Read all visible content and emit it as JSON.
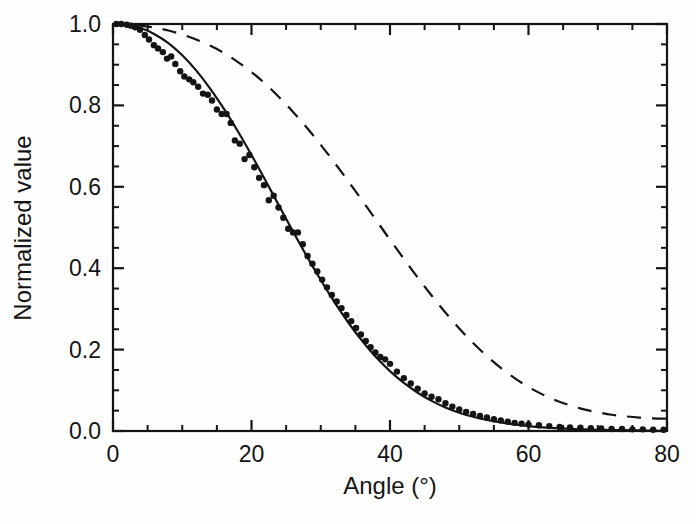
{
  "figure": {
    "background_color": "#fefefe",
    "ink_color": "#141414"
  },
  "chart_data": {
    "type": "line",
    "title": "",
    "subtitle": "",
    "xlabel": "Angle (°)",
    "ylabel": "Normalized value",
    "xlim": [
      0,
      80
    ],
    "ylim": [
      0.0,
      1.0
    ],
    "grid": false,
    "legend": null,
    "legend_position": "none",
    "frame": "box-all-sides",
    "tick_direction": "in",
    "xticks": [
      0,
      20,
      40,
      60,
      80
    ],
    "xtick_labels": [
      "0",
      "20",
      "40",
      "60",
      "80"
    ],
    "x_minor_tick_step": 5,
    "yticks": [
      0.0,
      0.2,
      0.4,
      0.6,
      0.8,
      1.0
    ],
    "ytick_labels": [
      "0.0",
      "0.2",
      "0.4",
      "0.6",
      "0.8",
      "1.0"
    ],
    "y_minor_tick_step": 0.05,
    "series": [
      {
        "name": "measured-fit",
        "style": "solid",
        "color": "#141414",
        "linewidth": 2.2,
        "has_markers": true,
        "marker": "filled-circle",
        "x": [
          0,
          2,
          4,
          6,
          8,
          10,
          12,
          14,
          16,
          18,
          20,
          22,
          24,
          26,
          28,
          30,
          32,
          34,
          36,
          38,
          40,
          42,
          44,
          46,
          48,
          50,
          52,
          54,
          56,
          58,
          60,
          62,
          64,
          66,
          68,
          70,
          72,
          74,
          76,
          78,
          80
        ],
        "values": [
          1.0,
          0.998,
          0.99,
          0.975,
          0.953,
          0.923,
          0.886,
          0.842,
          0.792,
          0.737,
          0.678,
          0.616,
          0.553,
          0.49,
          0.429,
          0.371,
          0.316,
          0.266,
          0.221,
          0.181,
          0.147,
          0.118,
          0.094,
          0.074,
          0.058,
          0.045,
          0.035,
          0.027,
          0.021,
          0.016,
          0.012,
          0.009,
          0.007,
          0.005,
          0.004,
          0.003,
          0.0025,
          0.002,
          0.0015,
          0.001,
          0.0
        ]
      },
      {
        "name": "model-prediction",
        "style": "dashed",
        "color": "#141414",
        "linewidth": 2.2,
        "has_markers": false,
        "marker": "none",
        "x": [
          0,
          2,
          4,
          6,
          8,
          10,
          12,
          14,
          16,
          18,
          20,
          22,
          24,
          26,
          28,
          30,
          32,
          34,
          36,
          38,
          40,
          42,
          44,
          46,
          48,
          50,
          52,
          54,
          56,
          58,
          60,
          62,
          64,
          66,
          68,
          70,
          72,
          74,
          76,
          78,
          80
        ],
        "values": [
          1.0,
          0.999,
          0.996,
          0.991,
          0.984,
          0.974,
          0.962,
          0.947,
          0.929,
          0.907,
          0.882,
          0.853,
          0.82,
          0.784,
          0.745,
          0.703,
          0.659,
          0.613,
          0.566,
          0.518,
          0.47,
          0.423,
          0.377,
          0.333,
          0.291,
          0.252,
          0.216,
          0.184,
          0.155,
          0.13,
          0.108,
          0.09,
          0.075,
          0.063,
          0.053,
          0.046,
          0.04,
          0.036,
          0.033,
          0.031,
          0.03
        ]
      }
    ],
    "scatter_points": {
      "name": "measured-data-points",
      "marker": "filled-circle",
      "color": "#141414",
      "size": 3.2,
      "x": [
        0.5,
        1.2,
        2.0,
        2.6,
        3.2,
        3.9,
        4.6,
        5.2,
        5.9,
        6.5,
        7.2,
        7.8,
        8.4,
        9.0,
        9.7,
        10.3,
        11.0,
        11.6,
        12.3,
        13.0,
        13.7,
        14.3,
        15.0,
        15.7,
        16.4,
        17.0,
        17.6,
        18.3,
        19.0,
        19.7,
        20.4,
        21.1,
        21.8,
        22.5,
        23.2,
        23.9,
        24.6,
        25.3,
        26.0,
        26.7,
        27.4,
        28.1,
        28.8,
        29.5,
        30.2,
        30.9,
        31.6,
        32.3,
        33.0,
        33.7,
        34.4,
        35.1,
        35.8,
        36.5,
        37.2,
        37.9,
        38.6,
        39.3,
        40.0,
        41.0,
        42.0,
        43.0,
        44.0,
        45.0,
        46.0,
        47.0,
        48.0,
        49.0,
        50.0,
        51.0,
        52.0,
        53.0,
        54.0,
        55.0,
        56.0,
        57.0,
        58.0,
        59.0,
        60.0,
        61.5,
        63.0,
        64.5,
        66.0,
        67.5,
        69.0,
        70.5,
        72.0,
        73.5,
        75.0,
        76.5,
        78.0,
        79.5
      ],
      "y": [
        1.0,
        1.0,
        0.998,
        0.996,
        0.992,
        0.986,
        0.973,
        0.962,
        0.948,
        0.94,
        0.931,
        0.915,
        0.92,
        0.902,
        0.884,
        0.871,
        0.864,
        0.857,
        0.846,
        0.829,
        0.826,
        0.812,
        0.79,
        0.779,
        0.779,
        0.757,
        0.714,
        0.706,
        0.668,
        0.678,
        0.648,
        0.622,
        0.604,
        0.567,
        0.578,
        0.549,
        0.524,
        0.497,
        0.488,
        0.488,
        0.459,
        0.43,
        0.411,
        0.392,
        0.372,
        0.353,
        0.334,
        0.318,
        0.302,
        0.285,
        0.27,
        0.253,
        0.237,
        0.221,
        0.206,
        0.193,
        0.182,
        0.176,
        0.165,
        0.146,
        0.13,
        0.117,
        0.104,
        0.092,
        0.084,
        0.078,
        0.068,
        0.06,
        0.053,
        0.047,
        0.042,
        0.037,
        0.033,
        0.029,
        0.026,
        0.023,
        0.02,
        0.018,
        0.016,
        0.014,
        0.012,
        0.01,
        0.009,
        0.008,
        0.007,
        0.006,
        0.005,
        0.005,
        0.004,
        0.004,
        0.003,
        0.003
      ]
    }
  }
}
